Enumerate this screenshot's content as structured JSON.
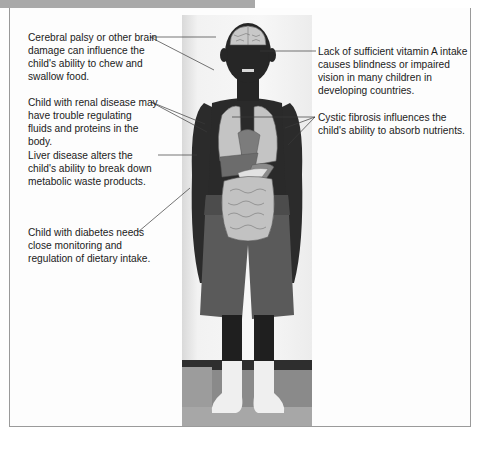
{
  "figure": {
    "header_bar_color": "#a9a9a9",
    "border_color": "#9a9a9a",
    "photo_description": "Child standing, with overlaid illustration of brain, lungs, heart, liver, stomach, pancreas, kidneys and intestines",
    "labels_left": [
      {
        "id": "brain",
        "text": "Cerebral palsy or other brain damage can influence the child's ability to chew and swallow food."
      },
      {
        "id": "renal",
        "text": "Child with renal disease may have trouble regulating fluids and proteins in the body."
      },
      {
        "id": "liver",
        "text": "Liver disease alters the child's ability to break down metabolic waste products."
      },
      {
        "id": "diabetes",
        "text": "Child with diabetes needs close monitoring and regulation of dietary intake."
      }
    ],
    "labels_right": [
      {
        "id": "vitamin-a",
        "text": "Lack of sufficient vitamin A intake causes blindness or impaired vision in many children in developing countries."
      },
      {
        "id": "cystic-fibrosis",
        "text": "Cystic fibrosis influences the child's ability to absorb nutrients."
      }
    ]
  }
}
